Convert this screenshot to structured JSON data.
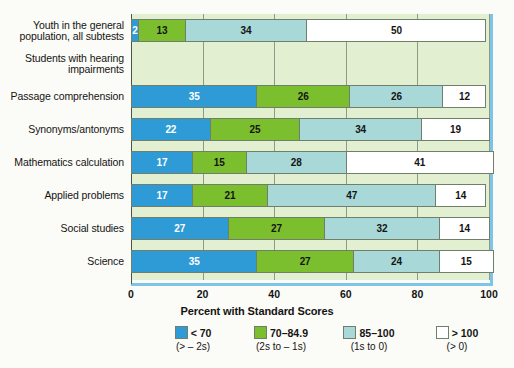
{
  "chart_data": {
    "type": "bar",
    "orientation": "horizontal",
    "stacked": true,
    "title": "",
    "xlabel": "Percent with Standard Scores",
    "ylabel": "",
    "xlim": [
      0,
      100
    ],
    "xticks": [
      0,
      20,
      40,
      60,
      80,
      100
    ],
    "xticklabels": [
      "0",
      "20",
      "40",
      "60",
      "80",
      "100"
    ],
    "grid": true,
    "legend_position": "bottom",
    "categories": [
      "Youth in the general population, all subtests",
      "Students with hearing impairments",
      "Passage comprehension",
      "Synonyms/antonyms",
      "Mathematics calculation",
      "Applied problems",
      "Social studies",
      "Science"
    ],
    "series": [
      {
        "name": "< 70",
        "sub": "(> – 2s)",
        "color": "#2E9BD6",
        "values": [
          2,
          null,
          35,
          22,
          17,
          17,
          27,
          35
        ]
      },
      {
        "name": "70–84.9",
        "sub": "(2s to – 1s)",
        "color": "#7CBF2E",
        "values": [
          13,
          null,
          26,
          25,
          15,
          21,
          27,
          27
        ]
      },
      {
        "name": "85–100",
        "sub": "(1s to 0)",
        "color": "#A8D8D8",
        "values": [
          34,
          null,
          26,
          34,
          28,
          47,
          32,
          24
        ]
      },
      {
        "name": "> 100",
        "sub": "(> 0)",
        "color": "#FFFFFF",
        "values": [
          50,
          null,
          12,
          19,
          41,
          14,
          14,
          15
        ]
      }
    ]
  },
  "axis": {
    "ticks": [
      "0",
      "20",
      "40",
      "60",
      "80",
      "100"
    ],
    "xlabel": "Percent with Standard Scores"
  },
  "rows": [
    {
      "label_line1": "Youth in the general",
      "label_line2": "population, all subtests",
      "has_bar": true,
      "segments": [
        {
          "value": 2,
          "label": "2",
          "series": 0
        },
        {
          "value": 13,
          "label": "13",
          "series": 1
        },
        {
          "value": 34,
          "label": "34",
          "series": 2
        },
        {
          "value": 50,
          "label": "50",
          "series": 3
        }
      ]
    },
    {
      "label_line1": "Students with hearing",
      "label_line2": "impairments",
      "has_bar": false,
      "segments": []
    },
    {
      "label_line1": "Passage comprehension",
      "label_line2": "",
      "has_bar": true,
      "segments": [
        {
          "value": 35,
          "label": "35",
          "series": 0
        },
        {
          "value": 26,
          "label": "26",
          "series": 1
        },
        {
          "value": 26,
          "label": "26",
          "series": 2
        },
        {
          "value": 12,
          "label": "12",
          "series": 3
        }
      ]
    },
    {
      "label_line1": "Synonyms/antonyms",
      "label_line2": "",
      "has_bar": true,
      "segments": [
        {
          "value": 22,
          "label": "22",
          "series": 0
        },
        {
          "value": 25,
          "label": "25",
          "series": 1
        },
        {
          "value": 34,
          "label": "34",
          "series": 2
        },
        {
          "value": 19,
          "label": "19",
          "series": 3
        }
      ]
    },
    {
      "label_line1": "Mathematics calculation",
      "label_line2": "",
      "has_bar": true,
      "segments": [
        {
          "value": 17,
          "label": "17",
          "series": 0
        },
        {
          "value": 15,
          "label": "15",
          "series": 1
        },
        {
          "value": 28,
          "label": "28",
          "series": 2
        },
        {
          "value": 41,
          "label": "41",
          "series": 3
        }
      ]
    },
    {
      "label_line1": "Applied problems",
      "label_line2": "",
      "has_bar": true,
      "segments": [
        {
          "value": 17,
          "label": "17",
          "series": 0
        },
        {
          "value": 21,
          "label": "21",
          "series": 1
        },
        {
          "value": 47,
          "label": "47",
          "series": 2
        },
        {
          "value": 14,
          "label": "14",
          "series": 3
        }
      ]
    },
    {
      "label_line1": "Social studies",
      "label_line2": "",
      "has_bar": true,
      "segments": [
        {
          "value": 27,
          "label": "27",
          "series": 0
        },
        {
          "value": 27,
          "label": "27",
          "series": 1
        },
        {
          "value": 32,
          "label": "32",
          "series": 2
        },
        {
          "value": 14,
          "label": "14",
          "series": 3
        }
      ]
    },
    {
      "label_line1": "Science",
      "label_line2": "",
      "has_bar": true,
      "segments": [
        {
          "value": 35,
          "label": "35",
          "series": 0
        },
        {
          "value": 27,
          "label": "27",
          "series": 1
        },
        {
          "value": 24,
          "label": "24",
          "series": 2
        },
        {
          "value": 15,
          "label": "15",
          "series": 3
        }
      ]
    }
  ],
  "legend": {
    "items": [
      {
        "label": "< 70",
        "sub": "(> – 2s)",
        "color": "#2E9BD6"
      },
      {
        "label": "70–84.9",
        "sub": "(2s to – 1s)",
        "color": "#7CBF2E"
      },
      {
        "label": "85–100",
        "sub": "(1s to 0)",
        "color": "#A8D8D8"
      },
      {
        "label": "> 100",
        "sub": "(> 0)",
        "color": "#FFFFFF"
      }
    ]
  },
  "colors": {
    "panel_background": "#E3EFD1",
    "frame_accent": "#7EC3E8",
    "gridline": "#8D9B86",
    "segment_border": "#6F7F6A"
  }
}
